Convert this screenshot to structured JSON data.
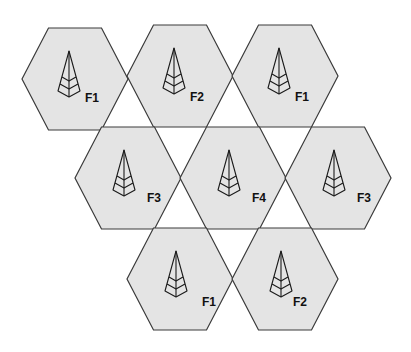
{
  "diagram": {
    "type": "cellular-frequency-reuse",
    "colors": {
      "cell_fill": "#e4e4e4",
      "cell_stroke": "#3a3a3a",
      "icon_stroke": "#1a1a1a",
      "label_color": "#111111"
    },
    "cells": [
      {
        "row": 1,
        "col": 1,
        "cx": 75,
        "cy": 79,
        "label": "F1"
      },
      {
        "row": 1,
        "col": 2,
        "cx": 180,
        "cy": 76,
        "label": "F2"
      },
      {
        "row": 1,
        "col": 3,
        "cx": 285,
        "cy": 76,
        "label": "F1"
      },
      {
        "row": 2,
        "col": 1,
        "cx": 128,
        "cy": 178,
        "label": "F3"
      },
      {
        "row": 2,
        "col": 2,
        "cx": 233,
        "cy": 178,
        "label": "F4"
      },
      {
        "row": 2,
        "col": 3,
        "cx": 338,
        "cy": 178,
        "label": "F3"
      },
      {
        "row": 3,
        "col": 1,
        "cx": 180,
        "cy": 279,
        "label": "F1"
      },
      {
        "row": 3,
        "col": 2,
        "cx": 285,
        "cy": 279,
        "label": "F2"
      }
    ],
    "icon": "cell-tower-icon"
  }
}
